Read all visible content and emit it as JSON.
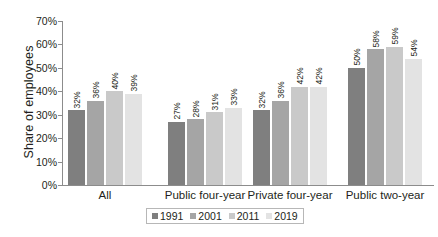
{
  "chart_data": {
    "type": "bar",
    "title": "",
    "subtitle": "",
    "xlabel": "",
    "ylabel": "Share of employees",
    "ylim": [
      0,
      70
    ],
    "ytick_labels": [
      "70%",
      "60%",
      "50%",
      "40%",
      "30%",
      "20%",
      "10%",
      "0%"
    ],
    "ytick_values": [
      70,
      60,
      50,
      40,
      30,
      20,
      10,
      0
    ],
    "grid": false,
    "legend_position": "bottom",
    "categories": [
      "All",
      "Public four-year",
      "Private four-year",
      "Public two-year"
    ],
    "series": [
      {
        "name": "1991",
        "color": "#7f7f7f",
        "values": [
          32,
          27,
          32,
          50
        ],
        "labels": [
          "32%",
          "27%",
          "32%",
          "50%"
        ]
      },
      {
        "name": "2001",
        "color": "#a5a5a5",
        "values": [
          36,
          28,
          36,
          58
        ],
        "labels": [
          "36%",
          "28%",
          "36%",
          "58%"
        ]
      },
      {
        "name": "2011",
        "color": "#c9c9c9",
        "values": [
          40,
          31,
          42,
          59
        ],
        "labels": [
          "40%",
          "31%",
          "42%",
          "59%"
        ]
      },
      {
        "name": "2019",
        "color": "#e3e3e3",
        "values": [
          39,
          33,
          42,
          54
        ],
        "labels": [
          "39%",
          "33%",
          "42%",
          "54%"
        ]
      }
    ]
  },
  "axis": {
    "line_color": "#8c8c8c"
  }
}
